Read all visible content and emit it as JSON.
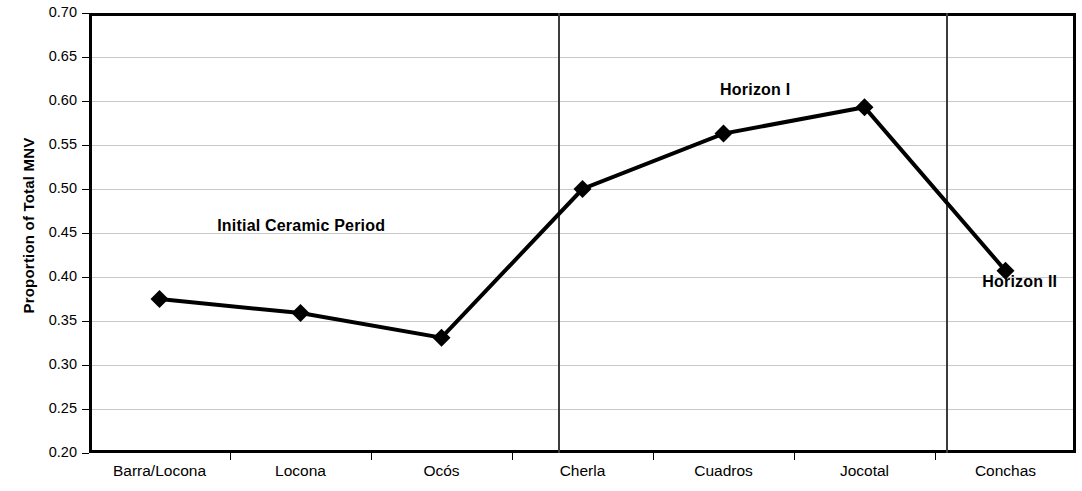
{
  "chart_data": {
    "type": "line",
    "title": "",
    "xlabel": "",
    "ylabel": "Proportion of Total MNV",
    "categories": [
      "Barra/Locona",
      "Locona",
      "Ocós",
      "Cherla",
      "Cuadros",
      "Jocotal",
      "Conchas"
    ],
    "values": [
      0.375,
      0.359,
      0.331,
      0.5,
      0.563,
      0.593,
      0.407
    ],
    "series": [
      {
        "name": "Proportion of Total MNV",
        "values": [
          0.375,
          0.359,
          0.331,
          0.5,
          0.563,
          0.593,
          0.407
        ],
        "marker": "diamond",
        "color": "#000000"
      }
    ],
    "ylim": [
      0.2,
      0.7
    ],
    "y_ticks": [
      "0.70",
      "0.65",
      "0.60",
      "0.55",
      "0.50",
      "0.45",
      "0.40",
      "0.35",
      "0.30",
      "0.25",
      "0.20"
    ],
    "y_tick_values": [
      0.7,
      0.65,
      0.6,
      0.55,
      0.5,
      0.45,
      0.4,
      0.35,
      0.3,
      0.25,
      0.2
    ],
    "grid": true,
    "grid_axis": "y",
    "legend": "none",
    "annotations": [
      {
        "text": "Initial Ceramic Period",
        "x": 0.215,
        "y": 0.485
      },
      {
        "text": "Horizon I",
        "x": 0.675,
        "y": 0.175
      },
      {
        "text": "Horizon II",
        "x": 0.943,
        "y": 0.612
      }
    ],
    "dividers": [
      {
        "label": "divider-after-ocos",
        "x": 0.475
      },
      {
        "label": "divider-after-jocotal",
        "x": 0.868
      }
    ],
    "colors": {
      "line": "#000000",
      "marker": "#000000",
      "gridline": "#c8c8c8",
      "axis": "#000000",
      "divider": "#3c3c3c",
      "background": "#ffffff"
    }
  }
}
